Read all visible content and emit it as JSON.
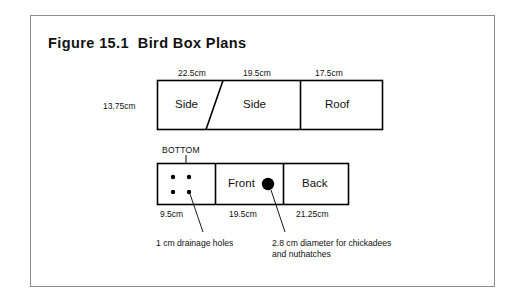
{
  "figure": {
    "title": "Figure 15.1  Bird Box Plans",
    "border_color": "#8d8d8d",
    "line_color": "#000000",
    "background": "#ffffff"
  },
  "top_row": {
    "height_label": "13.75cm",
    "panels": [
      {
        "name": "Side",
        "label": "Side",
        "width_label": "22.5cm"
      },
      {
        "name": "Side",
        "label": "Side",
        "width_label": "19.5cm"
      },
      {
        "name": "Roof",
        "label": "Roof",
        "width_label": "17.5cm"
      }
    ]
  },
  "bottom_row": {
    "bottom_tag": "BOTTOM",
    "panels": [
      {
        "name": "Bottom",
        "label": "",
        "width_label": "9.5cm"
      },
      {
        "name": "Front",
        "label": "Front",
        "width_label": "19.5cm"
      },
      {
        "name": "Back",
        "label": "Back",
        "width_label": "21.25cm"
      }
    ]
  },
  "annotations": {
    "drainage_holes": "1 cm drainage holes",
    "entrance_hole_line1": "2.8 cm diameter for chickadees",
    "entrance_hole_line2": "and nuthatches"
  }
}
